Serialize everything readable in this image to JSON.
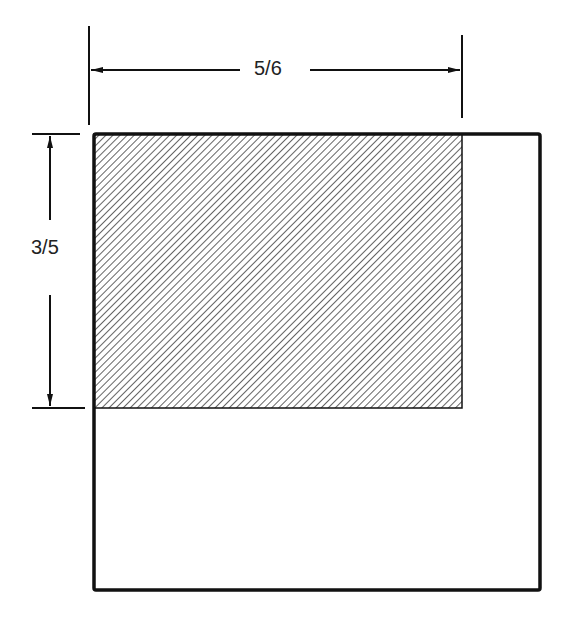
{
  "diagram": {
    "width_label": "5/6",
    "height_label": "3/5",
    "colors": {
      "stroke": "#111111",
      "hatch": "#222222",
      "background": "#ffffff"
    }
  }
}
